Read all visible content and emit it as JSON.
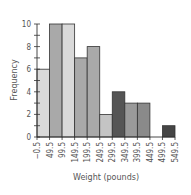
{
  "chart_data": {
    "type": "bar",
    "subtype": "histogram",
    "title": "",
    "xlabel": "Weight (pounds)",
    "ylabel": "Frequency",
    "ylim": [
      0,
      10
    ],
    "yticks": [
      0,
      2,
      4,
      6,
      8,
      10
    ],
    "bin_edges": [
      -0.5,
      49.5,
      99.5,
      149.5,
      199.5,
      249.5,
      299.5,
      349.5,
      399.5,
      449.5,
      499.5,
      549.5
    ],
    "xtick_labels": [
      "−0.5",
      "49.5",
      "99.5",
      "149.5",
      "199.5",
      "249.5",
      "299.5",
      "349.5",
      "399.5",
      "449.5",
      "499.5",
      "549.5"
    ],
    "categories": [
      "-0.5–49.5",
      "49.5–99.5",
      "99.5–149.5",
      "149.5–199.5",
      "199.5–249.5",
      "249.5–299.5",
      "299.5–349.5",
      "349.5–399.5",
      "399.5–449.5",
      "449.5–499.5",
      "499.5–549.5"
    ],
    "values": [
      6,
      10,
      10,
      7,
      8,
      2,
      4,
      3,
      3,
      0,
      1
    ],
    "bar_colors": [
      "#d9d9d9",
      "#a9a9a9",
      "#d9d9d9",
      "#a9a9a9",
      "#a9a9a9",
      "#c4c4c4",
      "#555555",
      "#9a9a9a",
      "#8a8a8a",
      "#ffffff",
      "#454545"
    ],
    "grid": false,
    "legend": null
  }
}
